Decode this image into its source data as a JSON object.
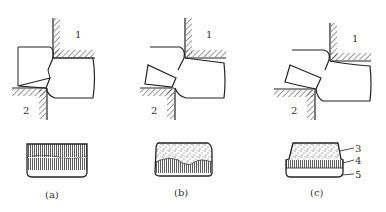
{
  "figure": {
    "panels": [
      {
        "id": "a",
        "caption": "(a)",
        "die_label_upper": "1",
        "die_label_lower": "2",
        "section": "fine-burnished-both-sides"
      },
      {
        "id": "b",
        "caption": "(b)",
        "die_label_upper": "1",
        "die_label_lower": "2",
        "section": "wavy-rough-fracture"
      },
      {
        "id": "c",
        "caption": "(c)",
        "die_label_upper": "1",
        "die_label_lower": "2",
        "section": "rollover-burnish-fracture"
      }
    ],
    "zone_labels": [
      "3",
      "4",
      "5"
    ]
  }
}
